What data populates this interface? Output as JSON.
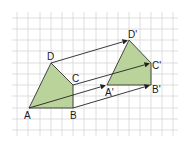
{
  "diagram": {
    "type": "translation",
    "grid": {
      "color": "#d6d6d6"
    },
    "shape_fill": "#b9d39a",
    "shape_stroke": "#333333",
    "arrow_color": "#222222",
    "labels": {
      "A": "A",
      "B": "B",
      "C": "C",
      "D": "D",
      "A2": "A'",
      "B2": "B'",
      "C2": "C'",
      "D2": "D'"
    },
    "original": {
      "A": [
        29,
        108
      ],
      "B": [
        73,
        108
      ],
      "C": [
        73,
        85
      ],
      "D": [
        51,
        63
      ]
    },
    "image": {
      "A2": [
        107,
        85
      ],
      "B2": [
        151,
        85
      ],
      "C2": [
        151,
        63
      ],
      "D2": [
        129,
        40
      ]
    }
  }
}
